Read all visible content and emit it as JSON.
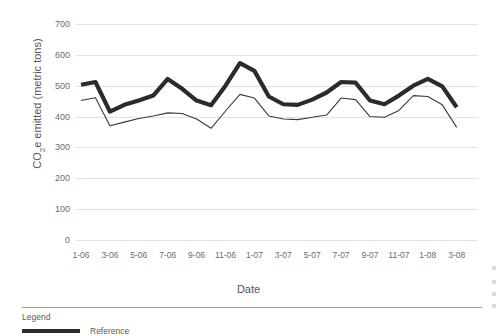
{
  "axis": {
    "y_title_main": "CO",
    "y_title_sub": "2",
    "y_title_rest": "e emitted (metric tons)",
    "x_title": "Date",
    "y_ticks": [
      "700",
      "600",
      "500",
      "400",
      "300",
      "200",
      "100",
      "0"
    ],
    "x_ticks": [
      "1-06",
      "3-06",
      "5-06",
      "7-06",
      "9-06",
      "11-06",
      "1-07",
      "3-07",
      "5-07",
      "7-07",
      "9-07",
      "11-07",
      "1-08",
      "3-08"
    ]
  },
  "legend": {
    "title": "Legend",
    "entries": [
      {
        "label": "Reference",
        "color": "#2b2b2b",
        "style": "thick"
      }
    ]
  },
  "colors": {
    "reference_line": "#2b2b2b",
    "actual_line": "#3a3a3a",
    "gridline": "#e2e2e2",
    "tick_text": "#6b6b6b",
    "axis_title": "#555555",
    "divider": "#9a9a9a",
    "background": "#ffffff"
  },
  "chart_data": {
    "type": "line",
    "title": "",
    "xlabel": "Date",
    "ylabel": "CO2e emitted (metric tons)",
    "ylim": [
      0,
      700
    ],
    "yticks": [
      0,
      100,
      200,
      300,
      400,
      500,
      600,
      700
    ],
    "grid": true,
    "legend_position": "below-plot",
    "x": [
      "1-06",
      "2-06",
      "3-06",
      "4-06",
      "5-06",
      "6-06",
      "7-06",
      "8-06",
      "9-06",
      "10-06",
      "11-06",
      "12-06",
      "1-07",
      "2-07",
      "3-07",
      "4-07",
      "5-07",
      "6-07",
      "7-07",
      "8-07",
      "9-07",
      "10-07",
      "11-07",
      "12-07",
      "1-08",
      "2-08",
      "3-08"
    ],
    "x_tick_labels": [
      "1-06",
      "3-06",
      "5-06",
      "7-06",
      "9-06",
      "11-06",
      "1-07",
      "3-07",
      "5-07",
      "7-07",
      "9-07",
      "11-07",
      "1-08",
      "3-08"
    ],
    "series": [
      {
        "name": "Reference",
        "color": "#2b2b2b",
        "linewidth": "thick",
        "values": [
          503,
          512,
          416,
          438,
          452,
          468,
          522,
          490,
          452,
          437,
          500,
          573,
          548,
          465,
          440,
          438,
          455,
          478,
          512,
          510,
          452,
          440,
          468,
          500,
          522,
          498,
          430
        ]
      },
      {
        "name": "",
        "color": "#3a3a3a",
        "linewidth": "thin",
        "values": [
          452,
          461,
          370,
          382,
          394,
          402,
          412,
          410,
          392,
          362,
          418,
          472,
          460,
          402,
          392,
          390,
          398,
          405,
          460,
          455,
          400,
          398,
          420,
          468,
          465,
          438,
          365
        ]
      }
    ]
  }
}
